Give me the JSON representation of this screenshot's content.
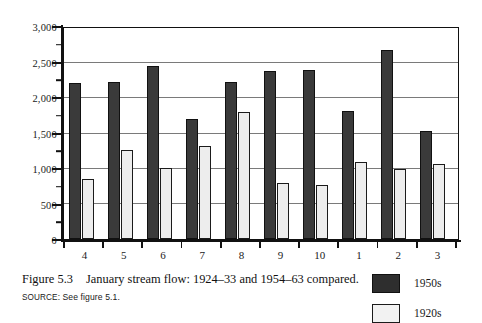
{
  "chart_data": {
    "type": "bar",
    "title": "",
    "xlabel": "",
    "ylabel": "",
    "ylim": [
      0,
      3000
    ],
    "grid": true,
    "legend_position": "bottom-right",
    "categories": [
      "4",
      "5",
      "6",
      "7",
      "8",
      "9",
      "10",
      "1",
      "2",
      "3"
    ],
    "y_ticks": [
      "0",
      "500",
      "1,000",
      "1,500",
      "2,000",
      "2,500",
      "3,000"
    ],
    "y_tick_values": [
      0,
      500,
      1000,
      1500,
      2000,
      2500,
      3000
    ],
    "y_minor_tick_values": [
      250,
      750,
      1250,
      1750,
      2250,
      2750
    ],
    "series": [
      {
        "name": "1950s",
        "color": "#3a3a3a",
        "values": [
          2220,
          2230,
          2460,
          1700,
          2230,
          2390,
          2410,
          1820,
          2690,
          1540
        ]
      },
      {
        "name": "1920s",
        "color": "#ededed",
        "values": [
          860,
          1260,
          1010,
          1320,
          1810,
          800,
          770,
          1100,
          990,
          1070
        ]
      }
    ]
  },
  "caption": {
    "figure_label": "Figure 5.3",
    "text": "January stream flow: 1924–33 and 1954–63 compared.",
    "source_word": "SOURCE:",
    "source_text": "See figure 5.1."
  },
  "legend": {
    "items": [
      {
        "label": "1950s",
        "swatch": "dark-swatch"
      },
      {
        "label": "1920s",
        "swatch": "light-swatch"
      }
    ]
  }
}
